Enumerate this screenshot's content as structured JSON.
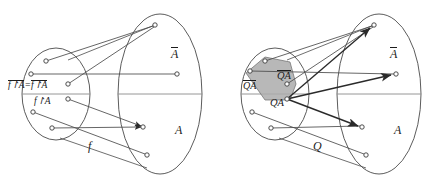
{
  "figure": {
    "type": "diagram",
    "background": "#ffffff",
    "stroke_color": "#3a3a3a",
    "shade_color": "#a8a8a8",
    "text_color": "#1c1c1c"
  },
  "panels": [
    {
      "id": "left-panel",
      "name": "function-diagram",
      "map_label": "f",
      "labels": {
        "restriction_top_left": "f↾A",
        "restriction_top_left_overline": true,
        "equals": "=",
        "restriction_top_right": "f↾A",
        "restriction_top_right_overline": true,
        "restriction_bottom": "f↾A",
        "codomain_upper": "A",
        "codomain_upper_overline": true,
        "codomain_lower": "A",
        "map": "f"
      },
      "domain_nodes": [
        {
          "id": "L-d1",
          "x": 46,
          "y": 61
        },
        {
          "id": "L-d2",
          "x": 31,
          "y": 74
        },
        {
          "id": "L-d3",
          "x": 68,
          "y": 84
        },
        {
          "id": "L-d4",
          "x": 68,
          "y": 99
        },
        {
          "id": "L-d5",
          "x": 33,
          "y": 112
        },
        {
          "id": "L-d6",
          "x": 52,
          "y": 128
        }
      ],
      "codomain_nodes": [
        {
          "id": "L-c1",
          "x": 155,
          "y": 25,
          "region": "A-bar"
        },
        {
          "id": "L-c2",
          "x": 177,
          "y": 74,
          "region": "A-bar"
        },
        {
          "id": "L-c3",
          "x": 143,
          "y": 127,
          "region": "A"
        },
        {
          "id": "L-c4",
          "x": 147,
          "y": 155,
          "region": "A"
        }
      ],
      "edges": [
        {
          "from": "L-d1",
          "to": "L-c1",
          "arrow": false
        },
        {
          "from": "L-d2",
          "to": "L-c2",
          "arrow": false
        },
        {
          "from": "L-d3",
          "to": "L-c1",
          "arrow": false
        },
        {
          "from": "L-d4",
          "to": "L-c3",
          "arrow": true
        },
        {
          "from": "L-d5",
          "to": "L-c4",
          "arrow": false
        },
        {
          "from": "L-d6",
          "to": "L-c3",
          "arrow": true
        }
      ]
    },
    {
      "id": "right-panel",
      "name": "relation-diagram",
      "map_label": "Q",
      "labels": {
        "region_outside": "QA",
        "region_outside_overline": true,
        "region_shaded": "QA",
        "region_shaded_overline": true,
        "region_lower": "QA",
        "region_lower_overline": false,
        "codomain_upper": "A",
        "codomain_upper_overline": true,
        "codomain_lower": "A",
        "map": "Q"
      },
      "domain_nodes": [
        {
          "id": "R-d1",
          "x": 265,
          "y": 61,
          "shaded": true
        },
        {
          "id": "R-d2",
          "x": 250,
          "y": 71,
          "shaded": true
        },
        {
          "id": "R-d3",
          "x": 287,
          "y": 84,
          "shaded": true
        },
        {
          "id": "R-d4",
          "x": 287,
          "y": 99,
          "shaded": true
        },
        {
          "id": "R-d5",
          "x": 252,
          "y": 112,
          "shaded": false
        },
        {
          "id": "R-d6",
          "x": 271,
          "y": 128,
          "shaded": false
        }
      ],
      "codomain_nodes": [
        {
          "id": "R-c1",
          "x": 374,
          "y": 25,
          "region": "A-bar"
        },
        {
          "id": "R-c2",
          "x": 396,
          "y": 74,
          "region": "A-bar"
        },
        {
          "id": "R-c3",
          "x": 362,
          "y": 127,
          "region": "A"
        },
        {
          "id": "R-c4",
          "x": 366,
          "y": 155,
          "region": "A"
        }
      ],
      "edges": [
        {
          "from": "R-d1",
          "to": "R-c1",
          "arrow": false
        },
        {
          "from": "R-d2",
          "to": "R-c2",
          "arrow": false
        },
        {
          "from": "R-d3",
          "to": "R-c1",
          "arrow": false
        },
        {
          "from": "R-d4",
          "to": "R-c1",
          "arrow": true
        },
        {
          "from": "R-d4",
          "to": "R-c2",
          "arrow": true
        },
        {
          "from": "R-d4",
          "to": "R-c3",
          "arrow": true
        },
        {
          "from": "R-d5",
          "to": "R-c4",
          "arrow": false
        },
        {
          "from": "R-d6",
          "to": "R-c3",
          "arrow": false
        }
      ],
      "shaded_region": "QA-bar"
    }
  ]
}
